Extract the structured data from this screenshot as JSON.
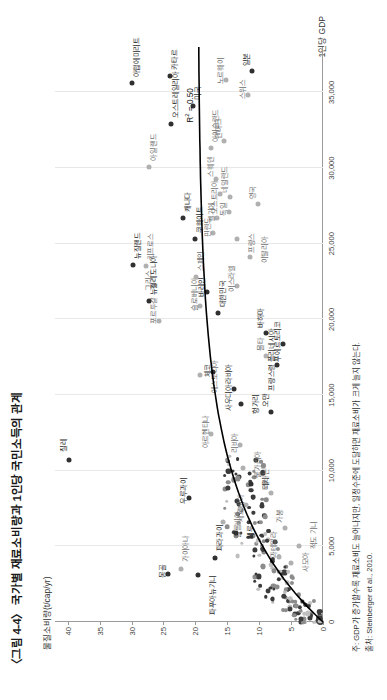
{
  "figure": {
    "title": "〈그림 4-4〉 국가별 재료소비량과 1인당 국민소득의 관계",
    "ylabel": "물질소비량(t/cap/yr)",
    "xlabel": "1인당 GDP",
    "note": "주: GDP가 증가할수록 재료소비도 늘어나지만, 일정수준에 도달하면 재료소비가 크게 늘지 않는다.",
    "source": "출처: Steinberger et al., 2010.",
    "r2_label": "R² = 0.50"
  },
  "chart_data": {
    "type": "scatter",
    "title": "〈그림 4-4〉 국가별 재료소비량과 1인당 국민소득의 관계",
    "xlabel": "1인당 GDP",
    "ylabel": "물질소비량(t/cap/yr)",
    "xlim": [
      0,
      38000
    ],
    "ylim": [
      0,
      42
    ],
    "xticks": [
      "0",
      "5,000",
      "10,000",
      "15,000",
      "20,000",
      "25,000",
      "30,000",
      "35,000"
    ],
    "xtick_values": [
      0,
      5000,
      10000,
      15000,
      20000,
      25000,
      30000,
      35000
    ],
    "yticks": [
      "0",
      "5",
      "10",
      "15",
      "20",
      "25",
      "30",
      "35",
      "40"
    ],
    "ytick_values": [
      0,
      5,
      10,
      15,
      20,
      25,
      30,
      35,
      40
    ],
    "grid": "vertical",
    "legend": "none",
    "annotation": "R² = 0.50",
    "trend": "logarithmic fit rising steeply at low GDP then flattening",
    "points": [
      {
        "label": "칠레",
        "x": 10700,
        "y": 39.8,
        "tone": "dark",
        "lx": 8,
        "ly": -11
      },
      {
        "label": "몽골",
        "x": 3200,
        "y": 24.3,
        "tone": "dark",
        "lx": -4,
        "ly": -11
      },
      {
        "label": "가이아나",
        "x": 3500,
        "y": 22.3,
        "tone": "light",
        "lx": 7,
        "ly": -1
      },
      {
        "label": "파푸아뉴기니",
        "x": 3100,
        "y": 19.6,
        "tone": "dark",
        "lx": -40,
        "ly": 9
      },
      {
        "label": "에스토니아",
        "x": 16300,
        "y": 19.2,
        "tone": "light",
        "lx": -18,
        "ly": 9
      },
      {
        "label": "슬로베니아",
        "x": 20900,
        "y": 19.3,
        "tone": "light",
        "lx": -5,
        "ly": -11
      },
      {
        "label": "우루과이",
        "x": 8200,
        "y": 21.0,
        "tone": "dark",
        "lx": -6,
        "ly": -11
      },
      {
        "label": "파라과이",
        "x": 4200,
        "y": 17.0,
        "tone": "dark",
        "lx": 7,
        "ly": -1
      },
      {
        "label": "체코",
        "x": 16500,
        "y": 17.2,
        "tone": "dark",
        "lx": -5,
        "ly": -11
      },
      {
        "label": "아르헨티나",
        "x": 12400,
        "y": 17.6,
        "tone": "light",
        "lx": -14,
        "ly": -11
      },
      {
        "label": "칠레",
        "x": 10700,
        "y": 39.8,
        "tone": "dark",
        "lx": 8,
        "ly": -11
      },
      {
        "label": "그리스",
        "x": 22300,
        "y": 26.5,
        "tone": "light",
        "lx": -6,
        "ly": -11
      },
      {
        "label": "키프로스",
        "x": 23500,
        "y": 27.7,
        "tone": "light",
        "lx": 6,
        "ly": -1
      },
      {
        "label": "포르투갈",
        "x": 19900,
        "y": 25.7,
        "tone": "light",
        "lx": -3,
        "ly": -11
      },
      {
        "label": "바레인",
        "x": 21800,
        "y": 18.2,
        "tone": "dark",
        "lx": -5,
        "ly": -11
      },
      {
        "label": "대한민국",
        "x": 20400,
        "y": 16.5,
        "tone": "dark",
        "lx": 6,
        "ly": -1
      },
      {
        "label": "사우디아라비아",
        "x": 15400,
        "y": 14.0,
        "tone": "dark",
        "lx": -22,
        "ly": -11
      },
      {
        "label": "리비아",
        "x": 11700,
        "y": 13.0,
        "tone": "light",
        "lx": -8,
        "ly": -11
      },
      {
        "label": "불가리아",
        "x": 10200,
        "y": 12.5,
        "tone": "light",
        "lx": -10,
        "ly": 9
      },
      {
        "label": "터키",
        "x": 9100,
        "y": 11.3,
        "tone": "dark",
        "lx": -6,
        "ly": 9
      },
      {
        "label": "세르비아",
        "x": 7700,
        "y": 12.1,
        "tone": "light",
        "lx": -16,
        "ly": -11
      },
      {
        "label": "헝가리",
        "x": 14400,
        "y": 12.8,
        "tone": "dark",
        "lx": -10,
        "ly": 9
      },
      {
        "label": "콜롬비아",
        "x": 6600,
        "y": 15.6,
        "tone": "light",
        "lx": -16,
        "ly": 9
      },
      {
        "label": "페루",
        "x": 5900,
        "y": 13.6,
        "tone": "dark",
        "lx": -6,
        "ly": 9
      },
      {
        "label": "레바논",
        "x": 8500,
        "y": 8.2,
        "tone": "light",
        "lx": 5,
        "ly": -11
      },
      {
        "label": "과테말라",
        "x": 4300,
        "y": 6.9,
        "tone": "light",
        "lx": -1,
        "ly": -11
      },
      {
        "label": "가봉",
        "x": 6200,
        "y": 5.9,
        "tone": "light",
        "lx": 5,
        "ly": -11
      },
      {
        "label": "사모아",
        "x": 3900,
        "y": 5.0,
        "tone": "light",
        "lx": -9,
        "ly": 9
      },
      {
        "label": "적도 기니",
        "x": 5000,
        "y": 3.7,
        "tone": "light",
        "lx": -3,
        "ly": 9
      },
      {
        "label": "몰타",
        "x": 17600,
        "y": 9.0,
        "tone": "light",
        "lx": 5,
        "ly": -11
      },
      {
        "label": "오만",
        "x": 13900,
        "y": 8.2,
        "tone": "dark",
        "lx": 5,
        "ly": -11
      },
      {
        "label": "바하마",
        "x": 19100,
        "y": 9.0,
        "tone": "dark",
        "lx": 5,
        "ly": -11
      },
      {
        "label": "프랑스령 폴리네시아",
        "x": 17000,
        "y": 7.2,
        "tone": "dark",
        "lx": -26,
        "ly": -11
      },
      {
        "label": "푸에르토리코",
        "x": 18400,
        "y": 6.3,
        "tone": "dark",
        "lx": -18,
        "ly": -11
      },
      {
        "label": "뉴질랜드",
        "x": 23600,
        "y": 29.8,
        "tone": "dark",
        "lx": 6,
        "ly": -1
      },
      {
        "label": "뉴칼레도니아",
        "x": 21200,
        "y": 27.2,
        "tone": "dark",
        "lx": 6,
        "ly": -1
      },
      {
        "label": "카타르",
        "x": 36100,
        "y": 24.0,
        "tone": "dark",
        "lx": 6,
        "ly": -1
      },
      {
        "label": "오스트레일리아",
        "x": 32900,
        "y": 23.8,
        "tone": "dark",
        "lx": 6,
        "ly": -1
      },
      {
        "label": "아랍에미리트",
        "x": 35600,
        "y": 29.9,
        "tone": "dark",
        "lx": 6,
        "ly": -1
      },
      {
        "label": "아일랜드",
        "x": 30100,
        "y": 27.3,
        "tone": "light",
        "lx": 6,
        "ly": -1
      },
      {
        "label": "쿠웨이트",
        "x": 25300,
        "y": 20.1,
        "tone": "dark",
        "lx": 6,
        "ly": -1
      },
      {
        "label": "캐나다",
        "x": 26700,
        "y": 22.0,
        "tone": "dark",
        "lx": 6,
        "ly": -1
      },
      {
        "label": "미국",
        "x": 34100,
        "y": 20.4,
        "tone": "dark",
        "lx": 6,
        "ly": -1
      },
      {
        "label": "아이슬란드",
        "x": 31300,
        "y": 17.6,
        "tone": "light",
        "lx": 6,
        "ly": -1
      },
      {
        "label": "덴마크",
        "x": 31800,
        "y": 15.5,
        "tone": "light",
        "lx": 2,
        "ly": -11
      },
      {
        "label": "노르웨이",
        "x": 35800,
        "y": 15.2,
        "tone": "light",
        "lx": -4,
        "ly": -11
      },
      {
        "label": "스위스",
        "x": 34800,
        "y": 11.8,
        "tone": "light",
        "lx": -4,
        "ly": -11
      },
      {
        "label": "일본",
        "x": 36400,
        "y": 11.1,
        "tone": "dark",
        "lx": 5,
        "ly": -11
      },
      {
        "label": "스웨덴",
        "x": 29300,
        "y": 16.7,
        "tone": "light",
        "lx": 2,
        "ly": -11
      },
      {
        "label": "오스트리아",
        "x": 28300,
        "y": 16.1,
        "tone": "light",
        "lx": -20,
        "ly": -11
      },
      {
        "label": "핀란드",
        "x": 25700,
        "y": 17.2,
        "tone": "light",
        "lx": -4,
        "ly": -11
      },
      {
        "label": "벨기에",
        "x": 26700,
        "y": 16.6,
        "tone": "light",
        "lx": -4,
        "ly": -11
      },
      {
        "label": "독일",
        "x": 27100,
        "y": 14.7,
        "tone": "light",
        "lx": -4,
        "ly": -11
      },
      {
        "label": "네덜란드",
        "x": 28100,
        "y": 14.6,
        "tone": "light",
        "lx": 4,
        "ly": -11
      },
      {
        "label": "영국",
        "x": 27600,
        "y": 10.2,
        "tone": "light",
        "lx": 5,
        "ly": -11
      },
      {
        "label": "이스라엘",
        "x": 22200,
        "y": 13.5,
        "tone": "light",
        "lx": -6,
        "ly": -11
      },
      {
        "label": "프랑스",
        "x": 25300,
        "y": 13.5,
        "tone": "light",
        "lx": -14,
        "ly": 9
      },
      {
        "label": "이탈리아",
        "x": 24100,
        "y": 11.5,
        "tone": "light",
        "lx": -6,
        "ly": 9
      },
      {
        "label": "스페인",
        "x": 22800,
        "y": 19.9,
        "tone": "light",
        "lx": 6,
        "ly": -1
      }
    ],
    "cluster_note": "dense unlabeled cluster of small dots near the origin below ~10 t/cap/yr and under ~8,000 GDP"
  }
}
